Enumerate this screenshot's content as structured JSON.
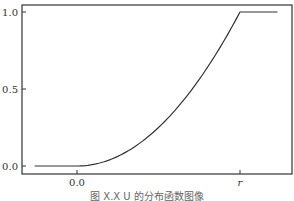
{
  "chart_data": {
    "type": "line",
    "title": "",
    "caption": "图 X.X   U 的分布函数图像",
    "xlabel": "",
    "ylabel": "",
    "x_tick_labels": [
      "0.0",
      "r"
    ],
    "y_tick_labels": [
      "0.0",
      "0.5",
      "1.0"
    ],
    "xlim_description": "from below 0 to beyond r",
    "ylim": [
      0.0,
      1.0
    ],
    "grid": false,
    "legend": null,
    "series": [
      {
        "name": "F(u)",
        "description": "CDF: 0 for u<0, (u/r)^2 for 0<=u<=r, 1 for u>r",
        "x": [
          -0.26,
          0.0,
          0.1,
          0.2,
          0.3,
          0.4,
          0.5,
          0.6,
          0.7,
          0.8,
          0.9,
          1.0,
          1.23
        ],
        "x_unit": "fraction of r",
        "values": [
          0.0,
          0.0,
          0.01,
          0.04,
          0.09,
          0.16,
          0.25,
          0.36,
          0.49,
          0.64,
          0.81,
          1.0,
          1.0
        ]
      }
    ],
    "line_color": "#333333"
  }
}
